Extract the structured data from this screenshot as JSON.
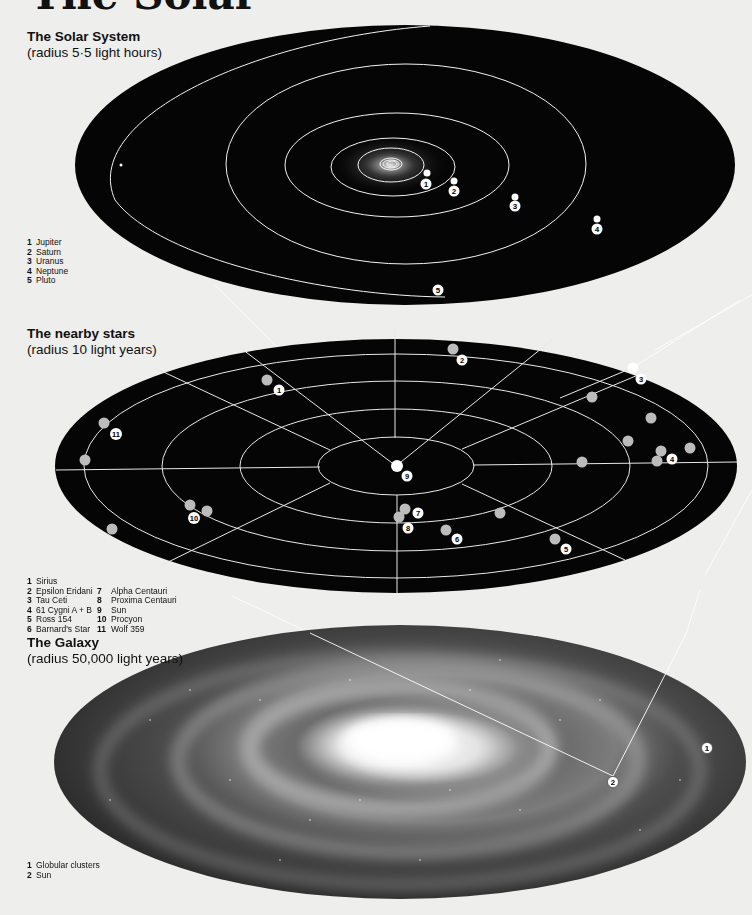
{
  "page": {
    "title_cropped": "The Solar",
    "background": "#eeeeec"
  },
  "solar_system": {
    "title": "The Solar System",
    "subtitle": "(radius 5·5 light hours)",
    "legend": [
      {
        "num": "1",
        "label": "Jupiter"
      },
      {
        "num": "2",
        "label": "Saturn"
      },
      {
        "num": "3",
        "label": "Uranus"
      },
      {
        "num": "4",
        "label": "Neptune"
      },
      {
        "num": "5",
        "label": "Pluto"
      }
    ],
    "markers": [
      "1",
      "2",
      "3",
      "4",
      "5"
    ]
  },
  "nearby_stars": {
    "title": "The nearby stars",
    "subtitle": "(radius 10 light years)",
    "legend_col1": [
      {
        "num": "1",
        "label": "Sirius"
      },
      {
        "num": "2",
        "label": "Epsilon Eridani"
      },
      {
        "num": "3",
        "label": "Tau Ceti"
      },
      {
        "num": "4",
        "label": "61 Cygni A + B"
      },
      {
        "num": "5",
        "label": "Ross 154"
      },
      {
        "num": "6",
        "label": "Barnard's Star"
      }
    ],
    "legend_col2": [
      {
        "num": "7",
        "label": "Alpha Centauri"
      },
      {
        "num": "8",
        "label": "Proxima Centauri"
      },
      {
        "num": "9",
        "label": "Sun"
      },
      {
        "num": "10",
        "label": "Procyon"
      },
      {
        "num": "11",
        "label": "Wolf 359"
      }
    ],
    "markers": [
      "1",
      "2",
      "3",
      "4",
      "5",
      "6",
      "7",
      "8",
      "9",
      "10",
      "11"
    ]
  },
  "galaxy": {
    "title": "The Galaxy",
    "subtitle": "(radius 50,000 light years)",
    "legend": [
      {
        "num": "1",
        "label": "Globular clusters"
      },
      {
        "num": "2",
        "label": "Sun"
      }
    ],
    "markers": [
      "1",
      "2"
    ]
  }
}
